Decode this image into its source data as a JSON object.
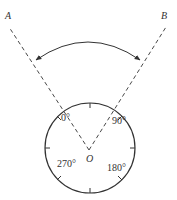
{
  "diagram": {
    "points": {
      "A": "A",
      "B": "B",
      "O": "O"
    },
    "dial_labels": {
      "deg0": "0°",
      "deg90": "90°",
      "deg180": "180°",
      "deg270": "270°"
    },
    "colors": {
      "stroke": "#333333",
      "background": "#ffffff"
    }
  }
}
